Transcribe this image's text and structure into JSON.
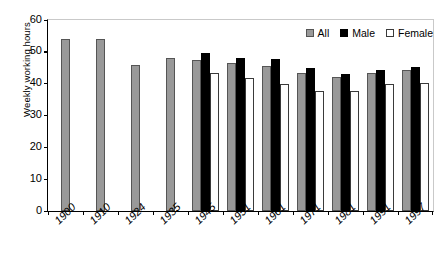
{
  "chart_data": {
    "type": "bar",
    "title": "",
    "xlabel": "",
    "ylabel": "Weekly working hours",
    "ylim": [
      0,
      60
    ],
    "yticks": [
      0,
      10,
      20,
      30,
      40,
      50,
      60
    ],
    "grid": false,
    "legend_position": "top-right",
    "categories": [
      "1900",
      "1910",
      "1924",
      "1935",
      "1945",
      "1951",
      "1961",
      "1971",
      "1981",
      "1991",
      "1997"
    ],
    "series": [
      {
        "name": "All",
        "color": "#999999",
        "values": [
          54.0,
          54.0,
          45.8,
          48.0,
          47.5,
          46.5,
          45.6,
          43.4,
          42.0,
          43.5,
          44.3
        ]
      },
      {
        "name": "Male",
        "color": "#000000",
        "values": [
          null,
          null,
          null,
          null,
          49.7,
          48.0,
          47.7,
          44.8,
          43.0,
          44.3,
          45.1
        ]
      },
      {
        "name": "Female",
        "color": "#ffffff",
        "values": [
          null,
          null,
          null,
          null,
          43.3,
          41.8,
          39.9,
          37.7,
          37.7,
          39.9,
          40.2
        ]
      }
    ]
  },
  "legend": {
    "items": [
      {
        "label": "All",
        "swatch": "all"
      },
      {
        "label": "Male",
        "swatch": "male"
      },
      {
        "label": "Female",
        "swatch": "female"
      }
    ]
  },
  "axes": {
    "y_title": "Weekly working hours"
  }
}
